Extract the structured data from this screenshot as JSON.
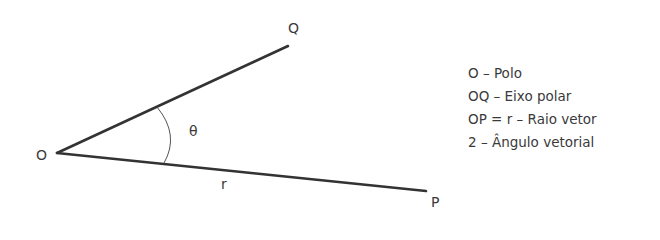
{
  "diagram": {
    "points": {
      "O": {
        "label": "O",
        "x": 57,
        "y": 153
      },
      "Q": {
        "label": "Q",
        "x": 288,
        "y": 46
      },
      "P": {
        "label": "P",
        "x": 426,
        "y": 191
      }
    },
    "angle_label": "θ",
    "segment_label": "r",
    "colors": {
      "line": "#333333",
      "arc": "#555555",
      "text": "#3a3a3a"
    }
  },
  "legend": {
    "items": [
      "O – Polo",
      "OQ – Eixo polar",
      "OP = r – Raio vetor",
      "2 – Ângulo vetorial"
    ]
  }
}
